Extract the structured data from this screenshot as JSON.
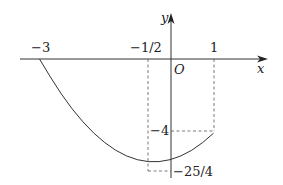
{
  "diagram": {
    "function": "y = x^2 + x - 6",
    "domain": [
      -3,
      1
    ],
    "axes": {
      "x_label": "x",
      "y_label": "y",
      "origin_label": "O"
    },
    "x_ticks": [
      "-3",
      "-1/2",
      "1"
    ],
    "y_ticks": [
      "-4",
      "-25/4"
    ],
    "colors": {
      "stroke": "#333333",
      "dashed": "#555555"
    }
  }
}
